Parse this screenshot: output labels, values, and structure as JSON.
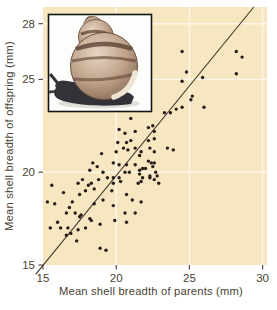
{
  "figure": {
    "colors": {
      "panel_background": "#f6e7c0",
      "gridline": "#fdf8ea",
      "dot": "#241d18",
      "regression_line": "#41382e",
      "axis_text": "#473f35",
      "inset_border": "#141414",
      "inset_background": "#fdfdfb"
    },
    "inset": {
      "name": "snail-photo",
      "alt": "Banded land snail"
    }
  },
  "chart_data": {
    "type": "scatter",
    "title": "",
    "xlabel": "Mean shell breadth of parents (mm)",
    "ylabel": "Mean shell breadth of offspring (mm)",
    "xlim": [
      15,
      30.3
    ],
    "ylim": [
      15,
      28.9
    ],
    "xticks": [
      15,
      20,
      25,
      30
    ],
    "yticks": [
      15,
      20,
      25,
      28
    ],
    "grid": true,
    "legend": "none",
    "regression_line": {
      "x1": 14.5,
      "y1": 14.5,
      "x2": 29.4,
      "y2": 28.9
    },
    "points": [
      [
        28.2,
        26.5
      ],
      [
        28.6,
        26.2
      ],
      [
        28.2,
        25.3
      ],
      [
        24.5,
        26.5
      ],
      [
        24.8,
        25.4
      ],
      [
        25.9,
        25.1
      ],
      [
        24.5,
        24.9
      ],
      [
        25.2,
        24.1
      ],
      [
        25.1,
        23.9
      ],
      [
        26.0,
        23.5
      ],
      [
        24.1,
        23.4
      ],
      [
        24.5,
        23.5
      ],
      [
        23.3,
        23.2
      ],
      [
        23.7,
        23.2
      ],
      [
        22.2,
        22.4
      ],
      [
        22.5,
        22.5
      ],
      [
        22.6,
        22.2
      ],
      [
        22.6,
        21.8
      ],
      [
        22.2,
        21.7
      ],
      [
        22.3,
        21.3
      ],
      [
        22.6,
        21.1
      ],
      [
        23.5,
        21.3
      ],
      [
        23.9,
        21.2
      ],
      [
        21.0,
        22.9
      ],
      [
        20.2,
        22.3
      ],
      [
        20.6,
        22.1
      ],
      [
        21.3,
        22.2
      ],
      [
        20.7,
        21.6
      ],
      [
        21.0,
        21.7
      ],
      [
        20.5,
        21.3
      ],
      [
        20.1,
        21.6
      ],
      [
        20.0,
        21.1
      ],
      [
        20.8,
        21.2
      ],
      [
        21.3,
        21.3
      ],
      [
        21.7,
        21.1
      ],
      [
        21.6,
        20.9
      ],
      [
        19.0,
        21.0
      ],
      [
        18.4,
        20.5
      ],
      [
        18.7,
        20.3
      ],
      [
        18.2,
        20.1
      ],
      [
        19.1,
        20.0
      ],
      [
        19.8,
        20.5
      ],
      [
        20.2,
        20.4
      ],
      [
        20.7,
        20.4
      ],
      [
        20.6,
        20.0
      ],
      [
        20.9,
        20.0
      ],
      [
        21.3,
        20.4
      ],
      [
        22.0,
        20.2
      ],
      [
        22.2,
        20.6
      ],
      [
        22.4,
        20.5
      ],
      [
        22.6,
        20.5
      ],
      [
        22.5,
        20.3
      ],
      [
        21.8,
        20.2
      ],
      [
        21.6,
        20.1
      ],
      [
        21.6,
        19.9
      ],
      [
        21.8,
        19.7
      ],
      [
        22.3,
        19.8
      ],
      [
        22.7,
        20.0
      ],
      [
        22.8,
        19.8
      ],
      [
        22.3,
        19.7
      ],
      [
        21.7,
        19.5
      ],
      [
        22.9,
        19.4
      ],
      [
        20.2,
        19.7
      ],
      [
        19.8,
        19.7
      ],
      [
        19.8,
        19.4
      ],
      [
        19.4,
        19.7
      ],
      [
        20.3,
        19.5
      ],
      [
        17.7,
        19.6
      ],
      [
        18.8,
        19.6
      ],
      [
        18.3,
        19.4
      ],
      [
        18.1,
        19.3
      ],
      [
        17.9,
        19.0
      ],
      [
        18.5,
        19.1
      ],
      [
        17.4,
        19.4
      ],
      [
        15.6,
        19.3
      ],
      [
        21.5,
        19.4
      ],
      [
        22.6,
        19.6
      ],
      [
        16.4,
        18.9
      ],
      [
        17.5,
        18.8
      ],
      [
        19.7,
        19.0
      ],
      [
        20.7,
        18.8
      ],
      [
        15.3,
        18.4
      ],
      [
        15.8,
        18.3
      ],
      [
        17.0,
        18.4
      ],
      [
        18.5,
        18.3
      ],
      [
        19.1,
        18.5
      ],
      [
        19.8,
        18.2
      ],
      [
        21.1,
        18.5
      ],
      [
        21.7,
        18.4
      ],
      [
        16.8,
        18.1
      ],
      [
        16.6,
        17.8
      ],
      [
        17.2,
        17.8
      ],
      [
        17.5,
        17.6
      ],
      [
        20.6,
        17.8
      ],
      [
        21.3,
        17.8
      ],
      [
        16.0,
        17.3
      ],
      [
        15.5,
        17.0
      ],
      [
        16.2,
        17.0
      ],
      [
        16.7,
        17.0
      ],
      [
        16.9,
        16.7
      ],
      [
        16.6,
        16.6
      ],
      [
        17.3,
        16.3
      ],
      [
        17.4,
        16.9
      ],
      [
        17.6,
        17.7
      ],
      [
        18.2,
        17.5
      ],
      [
        17.9,
        17.0
      ],
      [
        18.3,
        17.4
      ],
      [
        18.9,
        17.2
      ],
      [
        19.9,
        17.4
      ],
      [
        20.7,
        17.3
      ],
      [
        18.9,
        15.9
      ],
      [
        19.3,
        15.8
      ]
    ]
  }
}
